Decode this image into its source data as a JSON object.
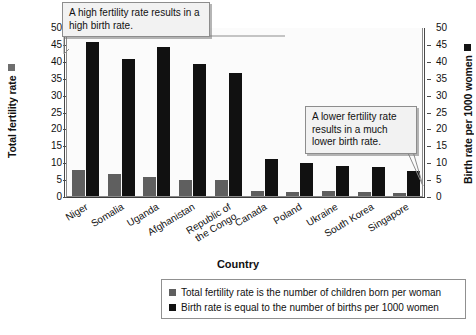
{
  "chart_data": {
    "type": "bar",
    "title": "",
    "xlabel": "Country",
    "categories": [
      "Niger",
      "Somalia",
      "Uganda",
      "Afghanistan",
      "Republic of the Congo",
      "Canada",
      "Poland",
      "Ukraine",
      "South Korea",
      "Singapore"
    ],
    "series": [
      {
        "name": "Total fertility rate",
        "axis": "left",
        "color": "#5f5f5f",
        "values": [
          7.6,
          6.4,
          5.6,
          4.8,
          4.8,
          1.6,
          1.3,
          1.5,
          1.2,
          0.8
        ]
      },
      {
        "name": "Birth rate per 1000 women",
        "axis": "right",
        "color": "#111111",
        "values": [
          45.5,
          40.5,
          44.0,
          39.0,
          36.5,
          11.0,
          9.8,
          9.0,
          8.5,
          7.3
        ]
      }
    ],
    "left_axis": {
      "label": "Total fertility rate",
      "ticks": [
        0,
        5,
        10,
        15,
        20,
        25,
        30,
        35,
        40,
        45,
        50
      ],
      "ylim": [
        0,
        50
      ]
    },
    "right_axis": {
      "label": "Birth rate per 1000 women",
      "ticks": [
        0,
        5,
        10,
        15,
        20,
        25,
        30,
        35,
        40,
        45,
        50
      ],
      "ylim": [
        0,
        50
      ]
    },
    "grid": false,
    "legend_position": "bottom"
  },
  "axes": {
    "y_left_title": "Total fertility rate",
    "y_right_title": "Birth rate per 1000 women",
    "x_title": "Country",
    "tick_labels": [
      "50",
      "45",
      "40",
      "35",
      "30",
      "25",
      "20",
      "15",
      "10",
      "5",
      "0"
    ]
  },
  "categories": [
    {
      "label": "Niger",
      "line1": "Niger",
      "line2": ""
    },
    {
      "label": "Somalia",
      "line1": "Somalia",
      "line2": ""
    },
    {
      "label": "Uganda",
      "line1": "Uganda",
      "line2": ""
    },
    {
      "label": "Afghanistan",
      "line1": "Afghanistan",
      "line2": ""
    },
    {
      "label": "Republic of the Congo",
      "line1": "Republic of",
      "line2": "the Congo"
    },
    {
      "label": "Canada",
      "line1": "Canada",
      "line2": ""
    },
    {
      "label": "Poland",
      "line1": "Poland",
      "line2": ""
    },
    {
      "label": "Ukraine",
      "line1": "Ukraine",
      "line2": ""
    },
    {
      "label": "South Korea",
      "line1": "South Korea",
      "line2": ""
    },
    {
      "label": "Singapore",
      "line1": "Singapore",
      "line2": ""
    }
  ],
  "callouts": {
    "high": "A high fertility rate results in a high birth rate.",
    "low": "A lower fertility rate results in a much lower birth rate."
  },
  "legend": {
    "items": [
      {
        "swatch_color": "#5f5f5f",
        "text": "Total fertility rate is the number of children born per woman"
      },
      {
        "swatch_color": "#111111",
        "text": "Birth rate is equal to the number of births per 1000 women"
      }
    ]
  },
  "colors": {
    "fertility_bar": "#5f5f5f",
    "birth_bar": "#111111",
    "plot_background": "#fbfbfb",
    "axis_line": "#4a4a4a",
    "callout_background": "#f2f2f2"
  }
}
